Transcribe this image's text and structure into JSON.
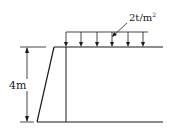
{
  "diagram": {
    "type": "retaining-wall",
    "height_label": "4m",
    "load_label": "2t/m",
    "load_exponent": "2",
    "load_arrow_count": 6,
    "line_color": "#1a1a1a"
  }
}
